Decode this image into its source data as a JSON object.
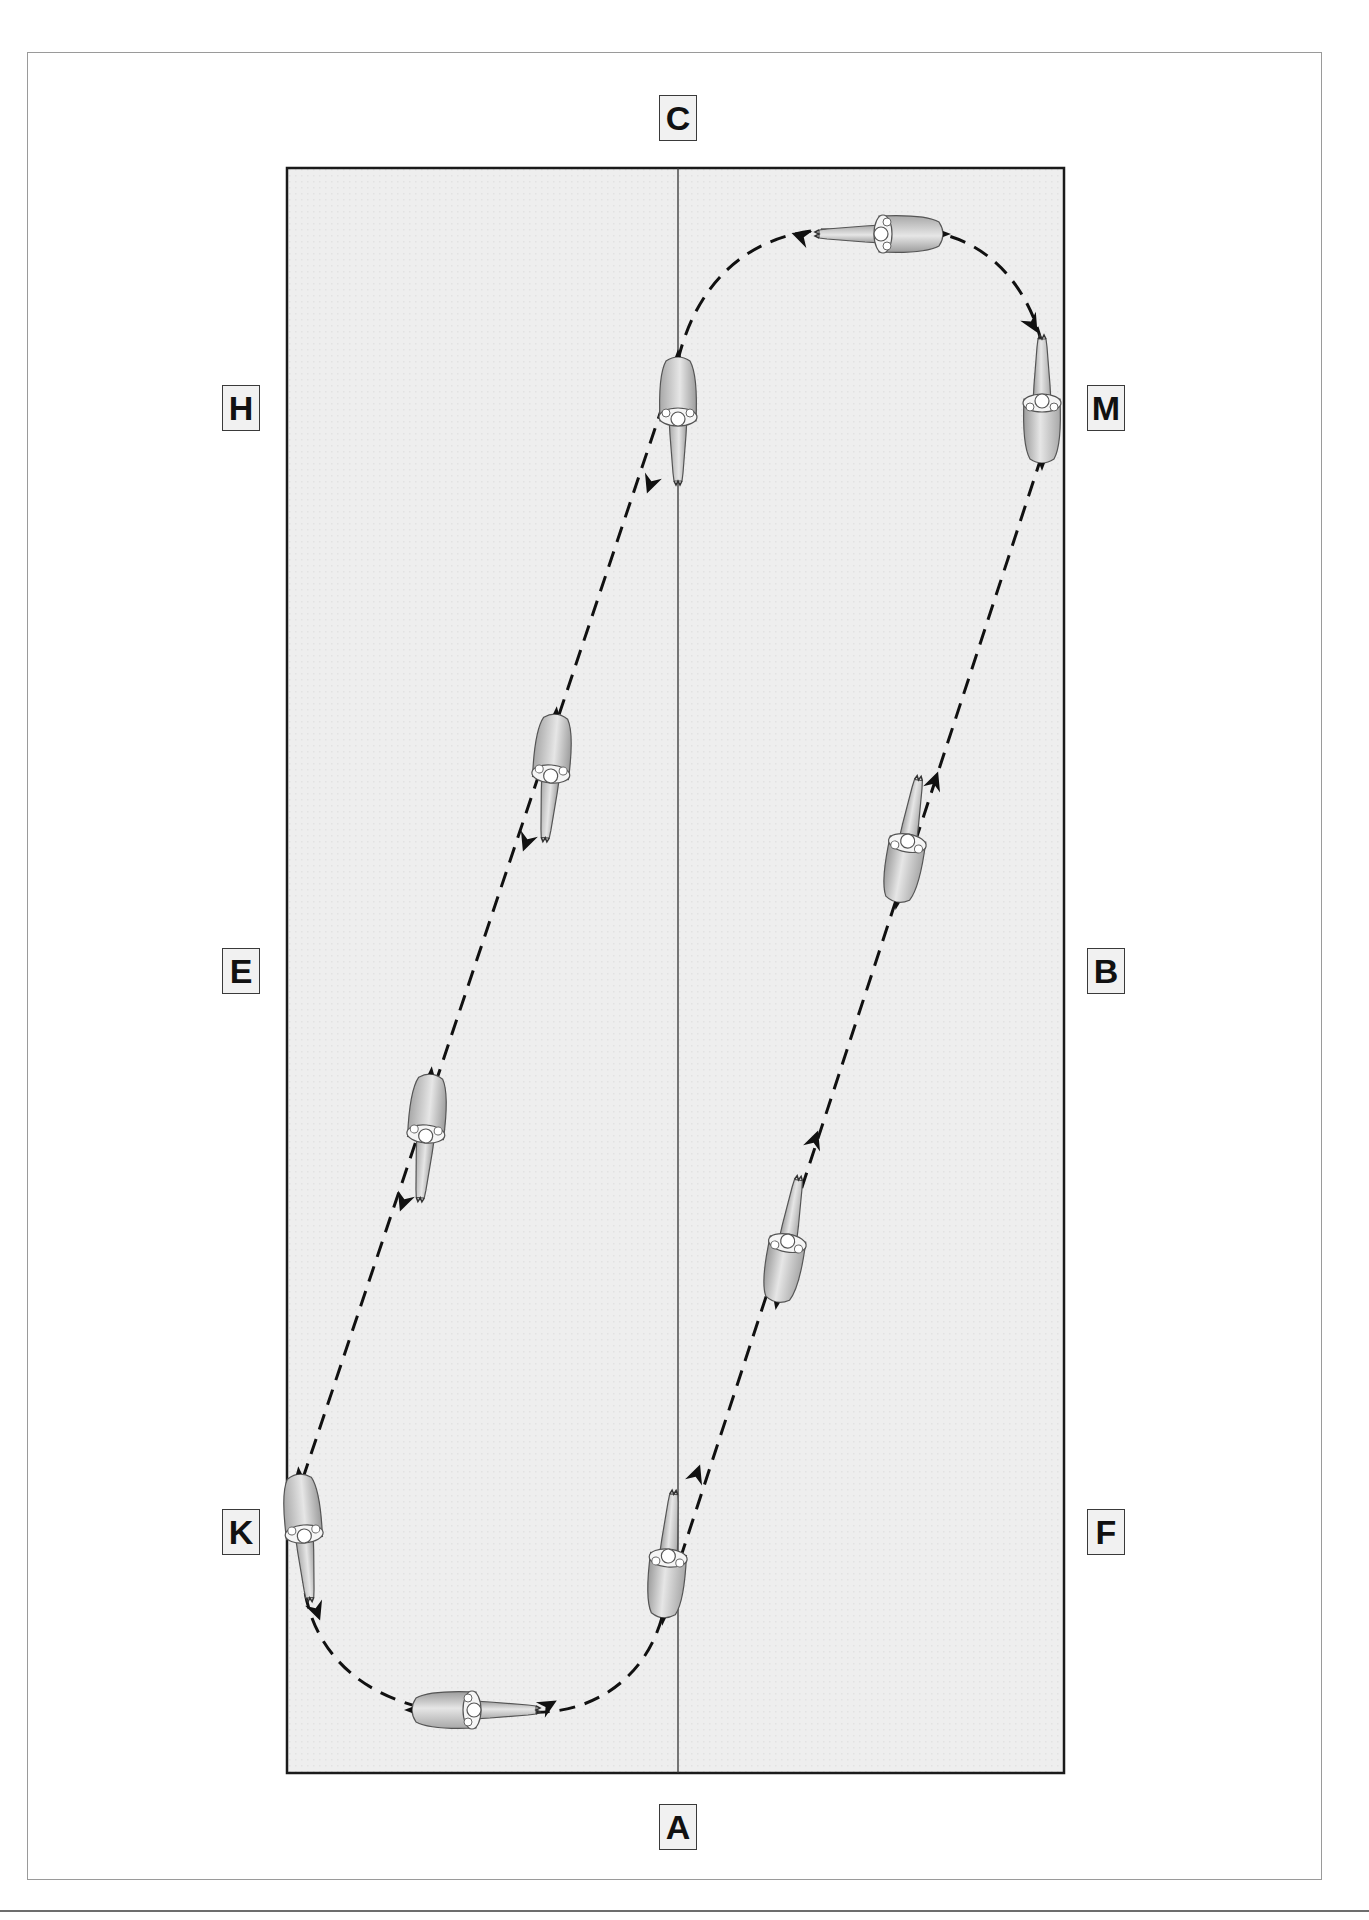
{
  "diagram": {
    "arena": {
      "fill": "#ececec",
      "border": "#1a1a1a",
      "centerline_color": "#333333"
    },
    "markers": [
      {
        "id": "C",
        "label": "C",
        "x": 678,
        "y": 118
      },
      {
        "id": "H",
        "label": "H",
        "x": 241,
        "y": 408
      },
      {
        "id": "M",
        "label": "M",
        "x": 1106,
        "y": 408
      },
      {
        "id": "E",
        "label": "E",
        "x": 241,
        "y": 971
      },
      {
        "id": "B",
        "label": "B",
        "x": 1106,
        "y": 971
      },
      {
        "id": "K",
        "label": "K",
        "x": 241,
        "y": 1532
      },
      {
        "id": "F",
        "label": "F",
        "x": 1106,
        "y": 1532
      },
      {
        "id": "A",
        "label": "A",
        "x": 678,
        "y": 1827
      }
    ],
    "path": {
      "style": "dashed",
      "color": "#111111",
      "direction_arrows": 12
    },
    "horses": [
      {
        "x": 678,
        "y": 410,
        "heading": 180
      },
      {
        "x": 880,
        "y": 234,
        "heading": 270
      },
      {
        "x": 1042,
        "y": 400,
        "heading": 0
      },
      {
        "x": 550,
        "y": 770,
        "heading": 200
      },
      {
        "x": 907,
        "y": 825,
        "heading": 20
      },
      {
        "x": 425,
        "y": 1130,
        "heading": 200
      },
      {
        "x": 786,
        "y": 1240,
        "heading": 20
      },
      {
        "x": 304,
        "y": 1535,
        "heading": 180
      },
      {
        "x": 668,
        "y": 1555,
        "heading": 10
      },
      {
        "x": 470,
        "y": 1710,
        "heading": 90
      }
    ]
  }
}
